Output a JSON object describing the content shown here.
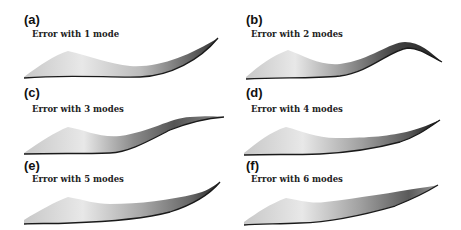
{
  "figure": {
    "panels": [
      {
        "id": "a",
        "label": "(a)",
        "caption": "Error with 1 mode",
        "modes": 1
      },
      {
        "id": "b",
        "label": "(b)",
        "caption": "Error with 2 modes",
        "modes": 2
      },
      {
        "id": "c",
        "label": "(c)",
        "caption": "Error with 3 modes",
        "modes": 3
      },
      {
        "id": "d",
        "label": "(d)",
        "caption": "Error with 4 modes",
        "modes": 4
      },
      {
        "id": "e",
        "label": "(e)",
        "caption": "Error with 5 modes",
        "modes": 5
      },
      {
        "id": "f",
        "label": "(f)",
        "caption": "Error with 6 modes",
        "modes": 6
      }
    ],
    "colors": {
      "surface_light": "#e6e6e6",
      "surface_mid": "#b0b0b0",
      "surface_dark": "#3a3a3a",
      "edge": "#1a1a1a"
    }
  }
}
